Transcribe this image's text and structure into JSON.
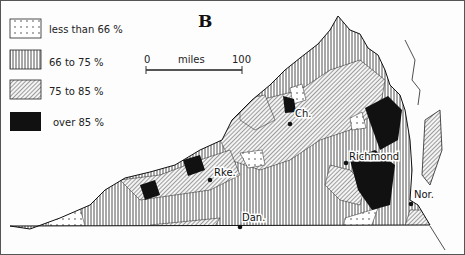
{
  "map": {
    "panel_label": "B",
    "legend": [
      {
        "pattern": "dots",
        "label": "less than 66 %"
      },
      {
        "pattern": "vertical-lines",
        "label": "66  to  75 %"
      },
      {
        "pattern": "diagonal-lines",
        "label": "75  to  85 %"
      },
      {
        "pattern": "solid-black",
        "label": "over  85 %"
      }
    ],
    "scale_bar": {
      "start": "0",
      "unit": "miles",
      "end": "100"
    },
    "cities": [
      {
        "abbr": "Ch.",
        "name": "Charlottesville"
      },
      {
        "abbr": "Richmond",
        "name": "Richmond"
      },
      {
        "abbr": "Rke.",
        "name": "Roanoke"
      },
      {
        "abbr": "Dan.",
        "name": "Danville"
      },
      {
        "abbr": "Nor.",
        "name": "Norfolk"
      }
    ],
    "colors": {
      "ink": "#111111",
      "paper": "#fdfdfd"
    }
  }
}
